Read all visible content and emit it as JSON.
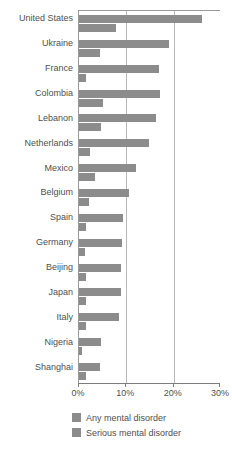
{
  "chart_data": {
    "type": "bar",
    "orientation": "horizontal",
    "title": "",
    "xlabel": "",
    "ylabel": "",
    "xlim": [
      0,
      30
    ],
    "xtick_labels": [
      "0%",
      "10%",
      "20%",
      "30%"
    ],
    "xtick_values": [
      0,
      10,
      20,
      30
    ],
    "gridlines": [
      10,
      20
    ],
    "grid": true,
    "legend_position": "bottom",
    "categories": [
      "United States",
      "Ukraine",
      "France",
      "Colombia",
      "Lebanon",
      "Netherlands",
      "Mexico",
      "Belgium",
      "Spain",
      "Germany",
      "Beijing",
      "Japan",
      "Italy",
      "Nigeria",
      "Shanghai"
    ],
    "series": [
      {
        "name": "Any mental disorder",
        "color": "#8c8c8c",
        "values": [
          26.0,
          19.0,
          17.0,
          17.2,
          16.2,
          14.7,
          12.0,
          10.6,
          9.2,
          9.1,
          8.8,
          8.8,
          8.4,
          4.7,
          4.5
        ]
      },
      {
        "name": "Serious mental disorder",
        "color": "#8c8c8c",
        "values": [
          7.8,
          4.4,
          1.5,
          5.1,
          4.6,
          2.3,
          3.4,
          2.2,
          1.5,
          1.2,
          1.5,
          1.4,
          1.4,
          0.6,
          1.5
        ]
      }
    ]
  },
  "legend": {
    "items": [
      {
        "label": "Any mental disorder",
        "color": "#8c8c8c"
      },
      {
        "label": "Serious mental disorder",
        "color": "#8c8c8c"
      }
    ]
  }
}
